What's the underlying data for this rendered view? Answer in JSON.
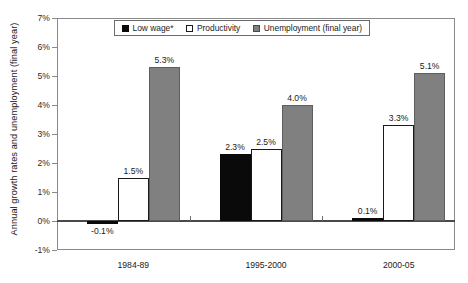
{
  "chart_data": {
    "type": "bar",
    "title": "",
    "xlabel": "",
    "ylabel": "Annual growth rates and unemployment (final year)",
    "ylim": [
      -1,
      7
    ],
    "ytick_labels": [
      "7%",
      "6%",
      "5%",
      "4%",
      "3%",
      "2%",
      "1%",
      "0%",
      "-1%"
    ],
    "ytick_values": [
      7,
      6,
      5,
      4,
      3,
      2,
      1,
      0,
      -1
    ],
    "grid": false,
    "legend_position": "top-center-inside",
    "categories": [
      "1984-89",
      "1995-2000",
      "2000-05"
    ],
    "series": [
      {
        "name": "Low wage*",
        "color": "#0a0a0a",
        "values": [
          -0.1,
          2.3,
          0.1
        ],
        "labels": [
          "-0.1%",
          "2.3%",
          "0.1%"
        ]
      },
      {
        "name": "Productivity",
        "color": "#ffffff",
        "values": [
          1.5,
          2.5,
          3.3
        ],
        "labels": [
          "1.5%",
          "2.5%",
          "3.3%"
        ]
      },
      {
        "name": "Unemployment (final year)",
        "color": "#808080",
        "values": [
          5.3,
          4.0,
          5.1
        ],
        "labels": [
          "5.3%",
          "4.0%",
          "5.1%"
        ]
      }
    ]
  },
  "axis": {
    "y_title": "Annual growth rates and unemployment (final year)"
  },
  "legend": {
    "items": [
      {
        "label": "Low wage*",
        "swatch": "low-wage"
      },
      {
        "label": "Productivity",
        "swatch": "productivity"
      },
      {
        "label": "Unemployment (final year)",
        "swatch": "unemployment"
      }
    ]
  }
}
